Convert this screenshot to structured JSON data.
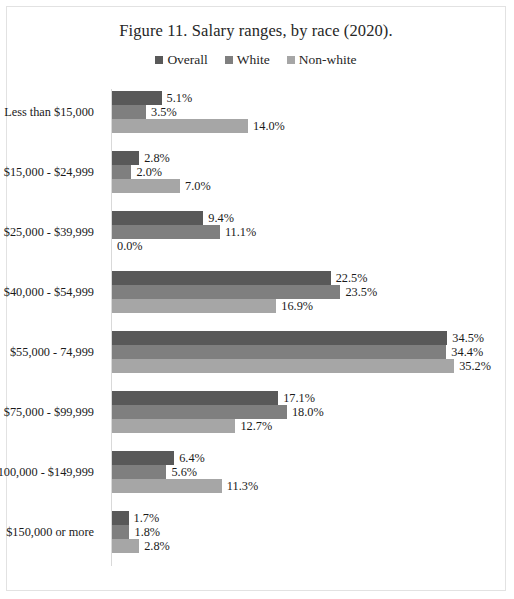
{
  "figure": {
    "title": "Figure 11. Salary ranges, by race (2020)."
  },
  "legend": {
    "position": "top-center",
    "items": [
      {
        "label": "Overall",
        "color": "#595959"
      },
      {
        "label": "White",
        "color": "#7f7f7f"
      },
      {
        "label": "Non-white",
        "color": "#a6a6a6"
      }
    ]
  },
  "chart_data": {
    "type": "bar",
    "orientation": "horizontal",
    "title": "Figure 11. Salary ranges, by race (2020).",
    "xlabel": "",
    "ylabel": "",
    "xlim": [
      0,
      35.2
    ],
    "grid": false,
    "value_suffix": "%",
    "categories": [
      "Less than $15,000",
      "$15,000 - $24,999",
      "$25,000 - $39,999",
      "$40,000 - $54,999",
      "$55,000 - 74,999",
      "$75,000 - $99,999",
      "$100,000 - $149,999",
      "$150,000 or more"
    ],
    "series": [
      {
        "name": "Overall",
        "color": "#595959",
        "values": [
          5.1,
          2.8,
          9.4,
          22.5,
          34.5,
          17.1,
          6.4,
          1.7
        ],
        "labels": [
          "5.1%",
          "2.8%",
          "9.4%",
          "22.5%",
          "34.5%",
          "17.1%",
          "6.4%",
          "1.7%"
        ]
      },
      {
        "name": "White",
        "color": "#7f7f7f",
        "values": [
          3.5,
          2.0,
          11.1,
          23.5,
          34.4,
          18.0,
          5.6,
          1.8
        ],
        "labels": [
          "3.5%",
          "2.0%",
          "11.1%",
          "23.5%",
          "34.4%",
          "18.0%",
          "5.6%",
          "1.8%"
        ]
      },
      {
        "name": "Non-white",
        "color": "#a6a6a6",
        "values": [
          14.0,
          7.0,
          0.0,
          16.9,
          35.2,
          12.7,
          11.3,
          2.8
        ],
        "labels": [
          "14.0%",
          "7.0%",
          "0.0%",
          "16.9%",
          "35.2%",
          "12.7%",
          "11.3%",
          "2.8%"
        ]
      }
    ]
  }
}
